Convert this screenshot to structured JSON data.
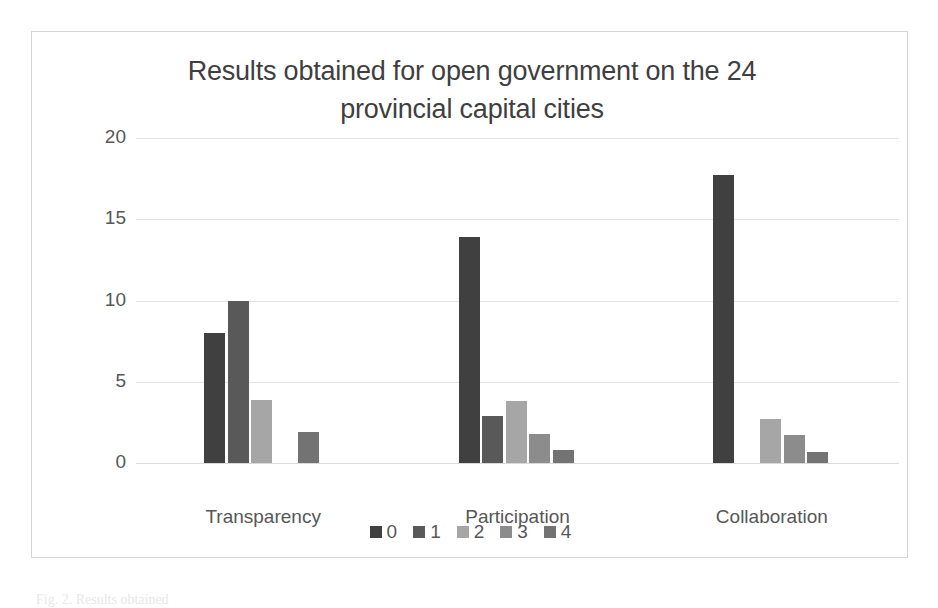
{
  "chart_data": {
    "type": "bar",
    "title": "Results obtained for open government on the 24 provincial capital cities",
    "title_line_1": "Results obtained for open government on the 24",
    "title_line_2": "provincial capital cities",
    "xlabel": "",
    "ylabel": "",
    "ylim": [
      0,
      20
    ],
    "yticks": [
      0,
      5,
      10,
      15,
      20
    ],
    "ytick_labels": [
      "0",
      "5",
      "10",
      "15",
      "20"
    ],
    "grid": true,
    "legend_position": "bottom",
    "categories": [
      "Transparency",
      "Participation",
      "Collaboration"
    ],
    "series": [
      {
        "name": "0",
        "color": "#404040",
        "values": [
          8.0,
          13.9,
          17.7
        ]
      },
      {
        "name": "1",
        "color": "#595959",
        "values": [
          10.0,
          2.9,
          0
        ]
      },
      {
        "name": "2",
        "color": "#a6a6a6",
        "values": [
          3.9,
          3.8,
          2.7
        ]
      },
      {
        "name": "3",
        "color": "#8c8c8c",
        "values": [
          0,
          1.8,
          1.7
        ]
      },
      {
        "name": "4",
        "color": "#737373",
        "values": [
          1.9,
          0.8,
          0.7
        ]
      }
    ]
  },
  "legend": {
    "items": [
      {
        "label": "0",
        "color": "#404040"
      },
      {
        "label": "1",
        "color": "#595959"
      },
      {
        "label": "2",
        "color": "#a6a6a6"
      },
      {
        "label": "3",
        "color": "#8c8c8c"
      },
      {
        "label": "4",
        "color": "#737373"
      }
    ]
  },
  "caption": "Fig. 2. Results obtained"
}
